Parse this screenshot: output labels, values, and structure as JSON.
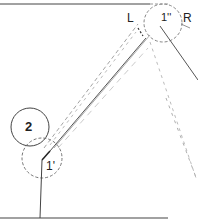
{
  "diagram": {
    "labels": {
      "L": "L",
      "R": "R",
      "node_2": "2",
      "node_1_prime": "1'",
      "node_1_double_prime": "1''"
    },
    "colors": {
      "ink": "#333333",
      "dash": "#888888",
      "background": "#ffffff"
    }
  }
}
